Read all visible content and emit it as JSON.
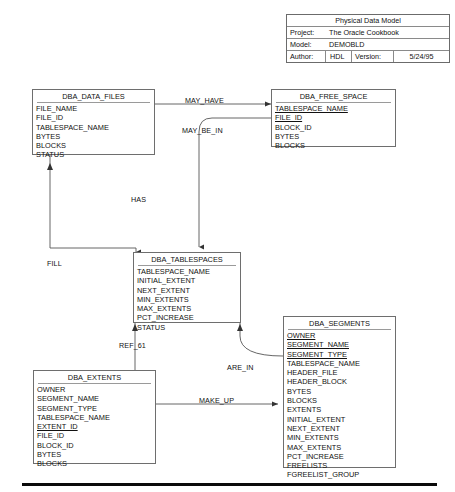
{
  "title_block": {
    "heading": "Physical Data Model",
    "rows": [
      {
        "label": "Project:",
        "value": "The Oracle Cookbook"
      },
      {
        "label": "Model:",
        "value": "DEMOBLD"
      }
    ],
    "author_label": "Author:",
    "author_value": "HDL",
    "version_label": "Version:",
    "version_value": "5/24/95"
  },
  "entities": [
    {
      "id": "dba_data_files",
      "name": "DBA_DATA_FILES",
      "attributes": [
        {
          "name": "FILE_NAME",
          "key": false
        },
        {
          "name": "FILE_ID",
          "key": false
        },
        {
          "name": "TABLESPACE_NAME",
          "key": false
        },
        {
          "name": "BYTES",
          "key": false
        },
        {
          "name": "BLOCKS",
          "key": false
        },
        {
          "name": "STATUS",
          "key": false
        }
      ]
    },
    {
      "id": "dba_free_space",
      "name": "DBA_FREE_SPACE",
      "attributes": [
        {
          "name": "TABLESPACE_NAME",
          "key": true
        },
        {
          "name": "FILE_ID",
          "key": true
        },
        {
          "name": "BLOCK_ID",
          "key": false
        },
        {
          "name": "BYTES",
          "key": false
        },
        {
          "name": "BLOCKS",
          "key": false
        }
      ]
    },
    {
      "id": "dba_tablespaces",
      "name": "DBA_TABLESPACES",
      "attributes": [
        {
          "name": "TABLESPACE_NAME",
          "key": false
        },
        {
          "name": "INITIAL_EXTENT",
          "key": false
        },
        {
          "name": "NEXT_EXTENT",
          "key": false
        },
        {
          "name": "MIN_EXTENTS",
          "key": false
        },
        {
          "name": "MAX_EXTENTS",
          "key": false
        },
        {
          "name": "PCT_INCREASE",
          "key": false
        },
        {
          "name": "STATUS",
          "key": false
        }
      ]
    },
    {
      "id": "dba_segments",
      "name": "DBA_SEGMENTS",
      "attributes": [
        {
          "name": "OWNER",
          "key": true
        },
        {
          "name": "SEGMENT_NAME",
          "key": true
        },
        {
          "name": "SEGMENT_TYPE",
          "key": true
        },
        {
          "name": "TABLESPACE_NAME",
          "key": false
        },
        {
          "name": "HEADER_FILE",
          "key": false
        },
        {
          "name": "HEADER_BLOCK",
          "key": false
        },
        {
          "name": "BYTES",
          "key": false
        },
        {
          "name": "BLOCKS",
          "key": false
        },
        {
          "name": "EXTENTS",
          "key": false
        },
        {
          "name": "INITIAL_EXTENT",
          "key": false
        },
        {
          "name": "NEXT_EXTENT",
          "key": false
        },
        {
          "name": "MIN_EXTENTS",
          "key": false
        },
        {
          "name": "MAX_EXTENTS",
          "key": false
        },
        {
          "name": "PCT_INCREASE",
          "key": false
        },
        {
          "name": "FREELISTS",
          "key": false
        },
        {
          "name": "FGREELIST_GROUP",
          "key": false
        }
      ]
    },
    {
      "id": "dba_extents",
      "name": "DBA_EXTENTS",
      "attributes": [
        {
          "name": "OWNER",
          "key": false
        },
        {
          "name": "SEGMENT_NAME",
          "key": false
        },
        {
          "name": "SEGMENT_TYPE",
          "key": false
        },
        {
          "name": "TABLESPACE_NAME",
          "key": false
        },
        {
          "name": "EXTENT_ID",
          "key": true
        },
        {
          "name": "FILE_ID",
          "key": false
        },
        {
          "name": "BLOCK_ID",
          "key": false
        },
        {
          "name": "BYTES",
          "key": false
        },
        {
          "name": "BLOCKS",
          "key": false
        }
      ]
    }
  ],
  "relationships": [
    {
      "id": "may_have",
      "label": "MAY_HAVE"
    },
    {
      "id": "may_be_in",
      "label": "MAY_BE_IN"
    },
    {
      "id": "has",
      "label": "HAS"
    },
    {
      "id": "fill",
      "label": "FILL"
    },
    {
      "id": "ref_61",
      "label": "REF_61"
    },
    {
      "id": "are_in",
      "label": "ARE_IN"
    },
    {
      "id": "make_up",
      "label": "MAKE_UP"
    }
  ],
  "colors": {
    "line": "#6e6e6e",
    "text": "#111111",
    "background": "#ffffff",
    "rule": "#0a0a0a"
  }
}
